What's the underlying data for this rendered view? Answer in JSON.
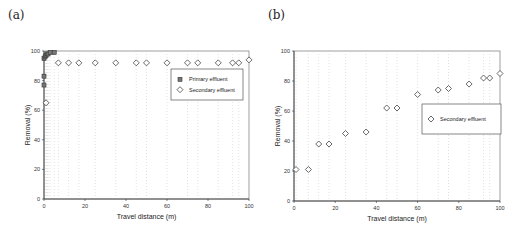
{
  "chart_data": [
    {
      "panel": "(a)",
      "type": "scatter",
      "title": "",
      "xlabel": "Travel distance (m)",
      "ylabel": "Removal (%)",
      "xlim": [
        0,
        100
      ],
      "ylim": [
        0,
        100
      ],
      "xticks": [
        0,
        20,
        40,
        60,
        80,
        100
      ],
      "yticks": [
        0,
        20,
        40,
        60,
        80,
        100
      ],
      "grid": "vertical dotted at data x positions",
      "legend_position": "upper right, inside",
      "series": [
        {
          "name": "Primary effluent",
          "marker": "square",
          "points": [
            [
              0,
              77
            ],
            [
              0,
              83
            ],
            [
              0,
              95
            ],
            [
              0.5,
              96
            ],
            [
              1,
              97
            ],
            [
              1.5,
              98
            ],
            [
              2,
              98
            ],
            [
              3,
              99
            ],
            [
              5,
              99
            ]
          ]
        },
        {
          "name": "Secondary effluent",
          "marker": "diamond",
          "points": [
            [
              1,
              65
            ],
            [
              7,
              92
            ],
            [
              12,
              92
            ],
            [
              17,
              92
            ],
            [
              25,
              92
            ],
            [
              35,
              92
            ],
            [
              45,
              92
            ],
            [
              50,
              92
            ],
            [
              60,
              92
            ],
            [
              70,
              92
            ],
            [
              75,
              92
            ],
            [
              85,
              92
            ],
            [
              92,
              92
            ],
            [
              95,
              92
            ],
            [
              100,
              94
            ]
          ]
        }
      ]
    },
    {
      "panel": "(b)",
      "type": "scatter",
      "title": "",
      "xlabel": "Travel distance (m)",
      "ylabel": "Removal (%)",
      "xlim": [
        0,
        100
      ],
      "ylim": [
        0,
        100
      ],
      "xticks": [
        0,
        20,
        40,
        60,
        80,
        100
      ],
      "yticks": [
        0,
        20,
        40,
        60,
        80,
        100
      ],
      "grid": "vertical dotted at data x positions",
      "legend_position": "center right, inside",
      "series": [
        {
          "name": "Secondary effluent",
          "marker": "diamond",
          "points": [
            [
              1,
              21
            ],
            [
              7,
              21
            ],
            [
              12,
              38
            ],
            [
              17,
              38
            ],
            [
              25,
              45
            ],
            [
              35,
              46
            ],
            [
              45,
              62
            ],
            [
              50,
              62
            ],
            [
              60,
              71
            ],
            [
              70,
              74
            ],
            [
              75,
              75
            ],
            [
              85,
              78
            ],
            [
              92,
              82
            ],
            [
              95,
              82
            ],
            [
              100,
              85
            ]
          ]
        }
      ]
    }
  ],
  "panels": [
    {
      "label": "(a)",
      "legend": [
        "Primary effluent",
        "Secondary effluent"
      ]
    },
    {
      "label": "(b)",
      "legend": [
        "Secondary effluent"
      ]
    }
  ]
}
